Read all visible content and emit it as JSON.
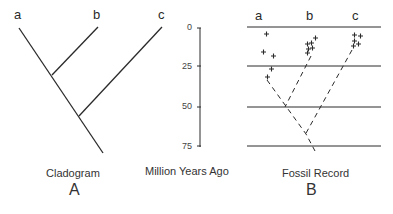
{
  "cladogram": {
    "taxa": [
      "a",
      "b",
      "c"
    ],
    "caption": "Cladogram",
    "panel_letter": "A"
  },
  "time_axis": {
    "label": "Million Years Ago",
    "ticks": [
      "0",
      "25",
      "50",
      "75"
    ]
  },
  "fossil_record": {
    "taxa": [
      "a",
      "b",
      "c"
    ],
    "caption": "Fossil Record",
    "panel_letter": "B"
  },
  "colors": {
    "line": "#2a2a2a",
    "background": "#ffffff"
  }
}
